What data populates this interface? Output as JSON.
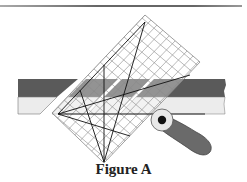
{
  "figure": {
    "caption": "Figure A",
    "colors": {
      "dark_fabric": "#5a5a5a",
      "light_fabric": "#ececec",
      "ruler_grid": "#8a8a8a",
      "cutter_handle": "#6a6a6a",
      "cutter_blade": "#e8e8e8"
    }
  }
}
